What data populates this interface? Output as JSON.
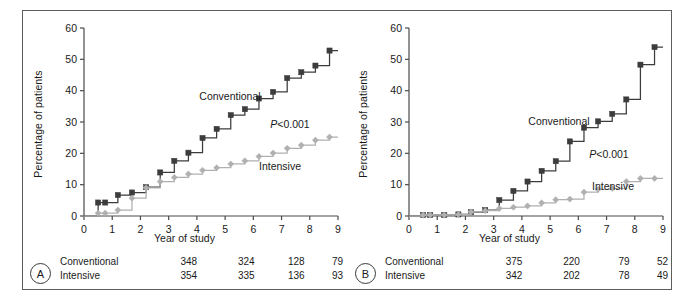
{
  "figure": {
    "axis": {
      "ylabel": "Percentage of patients",
      "xlabel": "Year of study",
      "yticks": [
        "0",
        "10",
        "20",
        "30",
        "40",
        "50",
        "60"
      ],
      "xticks": [
        "0",
        "1",
        "2",
        "3",
        "4",
        "5",
        "6",
        "7",
        "8",
        "9"
      ]
    },
    "colors": {
      "conventional": "#3c3c3c",
      "intensive": "#b0b0b0",
      "axis": "#4a4a4a",
      "text": "#1a1a1a",
      "frame": "#5d5d5d"
    },
    "panels": [
      {
        "id": "A",
        "badge": "A",
        "pvalue": "<0.001",
        "pvalue_symbol": "P",
        "labels": {
          "conventional": "Conventional",
          "intensive": "Intensive"
        },
        "risk_table": {
          "rows": [
            {
              "name": "Conventional",
              "values": [
                "348",
                "324",
                "128",
                "79"
              ]
            },
            {
              "name": "Intensive",
              "values": [
                "354",
                "335",
                "136",
                "93"
              ]
            }
          ]
        }
      },
      {
        "id": "B",
        "badge": "B",
        "pvalue": "<0.001",
        "pvalue_symbol": "P",
        "labels": {
          "conventional": "Conventional",
          "intensive": "Intensive"
        },
        "risk_table": {
          "rows": [
            {
              "name": "Conventional",
              "values": [
                "375",
                "220",
                "79",
                "52"
              ]
            },
            {
              "name": "Intensive",
              "values": [
                "342",
                "202",
                "78",
                "49"
              ]
            }
          ]
        }
      }
    ]
  },
  "chart_data": [
    {
      "type": "line",
      "panel": "A",
      "title": "",
      "xlabel": "Year of study",
      "ylabel": "Percentage of patients",
      "xlim": [
        0,
        9
      ],
      "ylim": [
        0,
        60
      ],
      "grid": false,
      "legend": "inline-labels",
      "annotations": [
        "P<0.001"
      ],
      "step": "post",
      "series": [
        {
          "name": "Conventional",
          "color": "#3c3c3c",
          "marker": "square",
          "x": [
            0.5,
            0.75,
            1.2,
            1.7,
            2.2,
            2.7,
            3.2,
            3.7,
            4.2,
            4.7,
            5.2,
            5.7,
            6.2,
            6.7,
            7.2,
            7.7,
            8.2,
            8.7
          ],
          "y": [
            4.3,
            4.3,
            6.7,
            7.5,
            9.2,
            13.9,
            17.6,
            20.2,
            24.9,
            27.8,
            32.2,
            34.1,
            37.5,
            39.6,
            44.0,
            45.9,
            48.0,
            52.8
          ]
        },
        {
          "name": "Intensive",
          "color": "#b0b0b0",
          "marker": "diamond",
          "x": [
            0.5,
            0.75,
            1.2,
            1.7,
            2.2,
            2.7,
            3.2,
            3.7,
            4.2,
            4.7,
            5.2,
            5.7,
            6.2,
            6.7,
            7.2,
            7.7,
            8.2,
            8.7
          ],
          "y": [
            0.9,
            0.9,
            1.9,
            5.7,
            9.0,
            11.0,
            12.3,
            13.4,
            14.6,
            15.4,
            16.6,
            17.6,
            19.0,
            20.1,
            21.6,
            22.6,
            24.2,
            25.2
          ]
        }
      ]
    },
    {
      "type": "line",
      "panel": "B",
      "title": "",
      "xlabel": "Year of study",
      "ylabel": "Percentage of patients",
      "xlim": [
        0,
        9
      ],
      "ylim": [
        0,
        60
      ],
      "grid": false,
      "legend": "inline-labels",
      "annotations": [
        "P<0.001"
      ],
      "step": "post",
      "series": [
        {
          "name": "Conventional",
          "color": "#3c3c3c",
          "marker": "square",
          "x": [
            0.5,
            0.75,
            1.25,
            1.75,
            2.2,
            2.7,
            3.2,
            3.7,
            4.2,
            4.7,
            5.2,
            5.7,
            6.2,
            6.7,
            7.2,
            7.7,
            8.2,
            8.7
          ],
          "y": [
            0.3,
            0.3,
            0.3,
            0.5,
            1.2,
            1.9,
            5.1,
            8.0,
            11.0,
            14.4,
            17.5,
            23.8,
            28.2,
            30.2,
            32.6,
            37.2,
            48.3,
            53.9
          ]
        },
        {
          "name": "Intensive",
          "color": "#b0b0b0",
          "marker": "diamond",
          "x": [
            0.5,
            0.75,
            1.25,
            1.75,
            2.2,
            2.7,
            3.2,
            3.7,
            4.2,
            4.7,
            5.2,
            5.7,
            6.2,
            6.7,
            7.2,
            7.7,
            8.2,
            8.7
          ],
          "y": [
            0.3,
            0.3,
            0.3,
            0.5,
            1.3,
            1.7,
            2.4,
            2.8,
            3.2,
            4.2,
            5.2,
            5.4,
            7.6,
            8.5,
            8.8,
            11.0,
            12.0,
            12.0
          ]
        }
      ]
    }
  ]
}
